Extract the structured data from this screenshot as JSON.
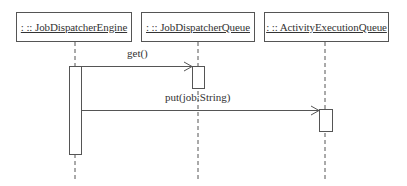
{
  "diagram": {
    "type": "uml-sequence",
    "lifelines": [
      {
        "id": "engine",
        "label": ": :: JobDispatcherEngine",
        "box": {
          "x": 16,
          "y": 12,
          "w": 116,
          "h": 30
        },
        "line_x": 75
      },
      {
        "id": "queue",
        "label": ": :: JobDispatcherQueue",
        "box": {
          "x": 141,
          "y": 12,
          "w": 114,
          "h": 30
        },
        "line_x": 198
      },
      {
        "id": "activity",
        "label": ": :: ActivityExecutionQueue",
        "box": {
          "x": 264,
          "y": 12,
          "w": 125,
          "h": 30
        },
        "line_x": 325
      }
    ],
    "messages": [
      {
        "from": "engine",
        "to": "queue",
        "label": "get()",
        "y": 66
      },
      {
        "from": "engine",
        "to": "activity",
        "label": "put(job:String)",
        "y": 110
      }
    ],
    "activations": [
      {
        "lifeline": "engine",
        "y_start": 67,
        "y_end": 154
      },
      {
        "lifeline": "queue",
        "y_start": 66,
        "y_end": 88
      },
      {
        "lifeline": "activity",
        "y_start": 110,
        "y_end": 131
      }
    ]
  }
}
